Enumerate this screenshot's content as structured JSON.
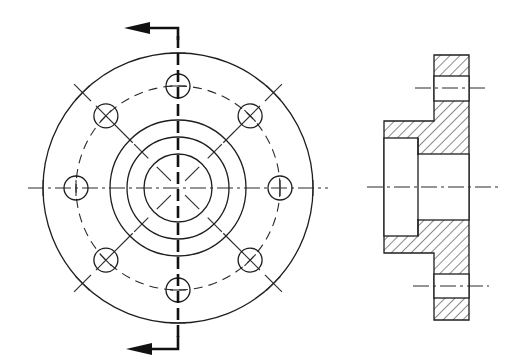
{
  "drawing": {
    "title": "Flange - front view and sectional side view",
    "views": [
      {
        "name": "front-view",
        "description": "Circular flange with 8 bolt holes on a pitch circle, hub and bore"
      },
      {
        "name": "section-view",
        "description": "Sectional side view showing flange, hub, counterbore and bolt holes with hatching"
      }
    ],
    "front_view": {
      "bolt_hole_count": 8,
      "concentric_circles": [
        "outer-flange",
        "bolt-pitch-circle",
        "hub-outer",
        "hub-step",
        "bore"
      ],
      "cutting_plane": {
        "orientation": "vertical",
        "arrow_direction": "left"
      }
    },
    "section_view": {
      "hatch_angle_deg": 45,
      "features": [
        "flange",
        "hub",
        "counterbore",
        "through-bore",
        "bolt-hole-top",
        "bolt-hole-bottom"
      ]
    },
    "colors": {
      "line": "#1e1e1e",
      "background": "#ffffff"
    }
  }
}
